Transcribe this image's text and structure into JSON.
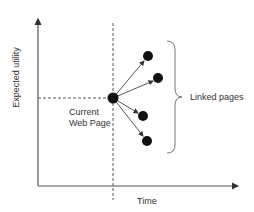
{
  "diagram": {
    "y_axis_label": "Expected utility",
    "x_axis_label": "Time",
    "current_node_label_line1": "Current",
    "current_node_label_line2": "Web Page",
    "brace_label": "Linked pages",
    "nodes": {
      "current": {
        "x": 113,
        "y": 98
      },
      "linked": [
        {
          "x": 148,
          "y": 56
        },
        {
          "x": 158,
          "y": 78
        },
        {
          "x": 143,
          "y": 116
        },
        {
          "x": 147,
          "y": 141
        }
      ]
    },
    "colors": {
      "line": "#444444",
      "node": "#111111",
      "text": "#333333"
    }
  }
}
